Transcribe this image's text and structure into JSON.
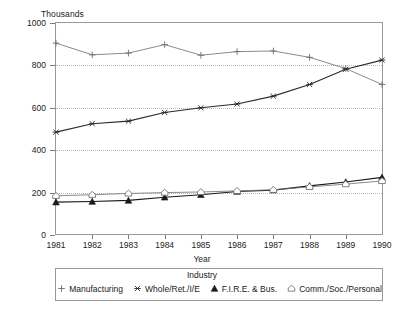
{
  "chart_data": {
    "type": "line",
    "title": "",
    "xlabel": "Year",
    "ylabel": "",
    "unit_label": "Thousands",
    "x": [
      1981,
      1982,
      1983,
      1984,
      1985,
      1986,
      1987,
      1988,
      1989,
      1990
    ],
    "categories": [
      "1981",
      "1982",
      "1983",
      "1984",
      "1985",
      "1986",
      "1987",
      "1988",
      "1989",
      "1990"
    ],
    "xlim": [
      1981,
      1990
    ],
    "ylim": [
      0,
      1000
    ],
    "yticks": [
      0,
      200,
      400,
      600,
      800,
      1000
    ],
    "ytick_labels": [
      "0",
      "200",
      "400",
      "600",
      "800",
      "1000"
    ],
    "grid": "horizontal-dotted",
    "legend_position": "below-axis",
    "legend_title": "Industry",
    "series": [
      {
        "name": "Manufacturing",
        "marker": "plus",
        "values": [
          905,
          850,
          858,
          898,
          848,
          865,
          868,
          838,
          785,
          710
        ]
      },
      {
        "name": "Whole/Ret./I/E",
        "marker": "cross-star",
        "values": [
          485,
          525,
          537,
          578,
          600,
          618,
          655,
          710,
          782,
          825
        ]
      },
      {
        "name": "F.I.R.E. & Bus.",
        "marker": "filled-triangle",
        "values": [
          155,
          158,
          163,
          178,
          190,
          205,
          212,
          232,
          250,
          272
        ]
      },
      {
        "name": "Comm./Soc./Personal",
        "marker": "open-pentagon",
        "values": [
          185,
          190,
          196,
          200,
          203,
          208,
          213,
          227,
          240,
          255
        ]
      }
    ]
  },
  "legend": {
    "title": "Industry",
    "entries": [
      {
        "label": "Manufacturing",
        "marker": "plus-icon"
      },
      {
        "label": "Whole/Ret./I/E",
        "marker": "cross-star-icon"
      },
      {
        "label": "F.I.R.E. & Bus.",
        "marker": "filled-triangle-icon"
      },
      {
        "label": "Comm./Soc./Personal",
        "marker": "open-pentagon-icon"
      }
    ]
  },
  "colors": {
    "frame": "#9a9a9a",
    "grid": "#b9b9b9",
    "series_manufacturing": "#6d6d6d",
    "series_whole_ret": "#2a2a2a",
    "series_fire": "#1a1a1a",
    "series_comm_soc": "#6d6d6d",
    "text": "#1a1a1a",
    "background": "#ffffff"
  }
}
